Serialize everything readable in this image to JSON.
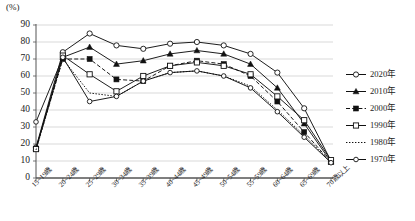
{
  "chart_data": {
    "type": "line",
    "title": "",
    "xlabel": "",
    "ylabel": "",
    "yunit": "(%)",
    "ylim": [
      0,
      90
    ],
    "ytick_step": 10,
    "yticks": [
      "90",
      "80",
      "70",
      "60",
      "50",
      "40",
      "30",
      "20",
      "10",
      "0"
    ],
    "grid": true,
    "legend_position": "right",
    "categories": [
      "15~19歳",
      "20~24歳",
      "25~29歳",
      "30~34歳",
      "35~39歳",
      "40~44歳",
      "45~49歳",
      "50~54歳",
      "55~59歳",
      "60~64歳",
      "65~69歳",
      "70歳以上"
    ],
    "series": [
      {
        "name": "2020年",
        "marker": "open-circle",
        "line": "solid",
        "values": [
          18.0,
          74.0,
          85.0,
          78.0,
          76.0,
          79.0,
          80.0,
          78.0,
          73.0,
          62.0,
          41.0,
          10.0
        ]
      },
      {
        "name": "2010年",
        "marker": "filled-triangle",
        "line": "solid",
        "values": [
          17.5,
          71.0,
          77.0,
          67.0,
          69.0,
          73.0,
          75.0,
          73.0,
          67.0,
          53.0,
          32.0,
          9.5
        ]
      },
      {
        "name": "2000年",
        "marker": "filled-square",
        "line": "dashed",
        "values": [
          17.0,
          70.0,
          70.0,
          58.0,
          57.0,
          66.0,
          69.0,
          67.0,
          60.0,
          45.0,
          27.0,
          9.3
        ]
      },
      {
        "name": "1990年",
        "marker": "open-square",
        "line": "solid",
        "values": [
          17.0,
          72.0,
          61.0,
          51.0,
          60.0,
          66.0,
          68.0,
          66.0,
          61.0,
          48.0,
          34.0,
          10.5
        ]
      },
      {
        "name": "1980年",
        "marker": "none",
        "line": "dotted",
        "values": [
          16.5,
          70.0,
          50.0,
          48.0,
          57.0,
          62.0,
          63.0,
          60.0,
          54.0,
          40.0,
          25.0,
          9.2
        ]
      },
      {
        "name": "1970年",
        "marker": "open-circle-small",
        "line": "solid",
        "values": [
          33.0,
          71.0,
          45.0,
          48.0,
          57.0,
          62.0,
          63.0,
          60.0,
          53.0,
          39.0,
          24.0,
          9.0
        ]
      }
    ]
  }
}
